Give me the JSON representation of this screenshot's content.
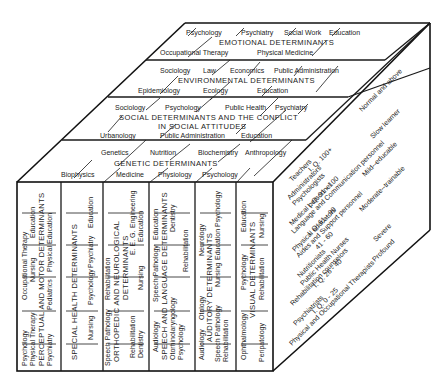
{
  "diagram": {
    "type": "3d-cube",
    "top_face": {
      "layers": [
        {
          "title": "EMOTIONAL DETERMINANTS",
          "back_row": [
            "Psychology",
            "Psychiatry",
            "Social Work",
            "Education"
          ],
          "front_row": [
            "Occupational Therapy",
            "Physical Medicine"
          ]
        },
        {
          "title": "ENVIRONMENTAL DETERMINANTS",
          "back_row": [
            "Sociology",
            "Law",
            "Economics",
            "Public Administration"
          ],
          "front_row": [
            "Epidemiology",
            "Ecology",
            "Education"
          ]
        },
        {
          "title_line1": "SOCIAL DETERMINANTS AND THE CONFLICT",
          "title_line2": "IN SOCIAL ATTITUDES",
          "back_row": [
            "Sociology",
            "Psychology",
            "Public Health",
            "Psychiatry"
          ],
          "front_row": [
            "Urbanology",
            "Public Administration",
            "Education"
          ]
        },
        {
          "title": "GENETIC DETERMINANTS",
          "back_row": [
            "Genetics",
            "Nutrition",
            "Biochemistry",
            "Anthropology"
          ],
          "front_row": [
            "Biophysics",
            "Medicine",
            "Physiology",
            "Psychology"
          ]
        }
      ]
    },
    "front_face": {
      "columns": [
        {
          "title": "PERCEPTUAL AND MOTOR DETERMINANTS",
          "line1": [
            "Psychology",
            "Occupational Therapy"
          ],
          "line2": [
            "Physical Therapy",
            "Nursing",
            "Education"
          ],
          "line4": [
            "Psychiatry",
            "Pediatrics",
            "Physical Education"
          ]
        },
        {
          "title": "SPECIAL HEALTH DETERMINANTS",
          "line2": [
            "Nursing",
            "Psychology",
            "Psychiatry",
            "Education"
          ]
        },
        {
          "title_line1": "ORTHOPEDIC AND NEUROLOGICAL",
          "title_line2": "DETERMINANTS",
          "line1": [
            "Speech Pathology",
            "Rehabilitation"
          ],
          "line3": [
            "Rehabilitation",
            "E. E. G.",
            "Engineering"
          ],
          "line4": [
            "Dentistry",
            "Nursing",
            "Education"
          ],
          "prefix_top": "Dentistry",
          "prefix_top2": "Nursing",
          "prefix_top3": "Education"
        },
        {
          "title": "SPEECH AND LANGUAGE DETERMINANTS",
          "line1": [
            "Audiology",
            "Speech Pathology",
            "Education"
          ],
          "line3": [
            "Otorhinolaryngology",
            "Dentistry"
          ],
          "line4": [
            "Psychology",
            "Rehabilitation"
          ]
        },
        {
          "title": "AUDITORY DETERMINANTS",
          "line1": [
            "Audiology",
            "Otology",
            "Neurology"
          ],
          "line3": [
            "Speech Pathology",
            "Nursing",
            "Education Psychology"
          ],
          "line4": [
            "Rehabilitation"
          ],
          "prefix": [
            "Rehabilitation",
            "Nursing"
          ]
        },
        {
          "title": "VISUAL DETERMINANTS",
          "line1": [
            "Ophthalmology",
            "Psychology",
            "Education"
          ],
          "line3": [
            "Peripatology",
            "Rehabilitation",
            "Nursing"
          ]
        }
      ]
    },
    "right_face": {
      "levels": [
        {
          "label": "Normal and above",
          "personnel": [
            "Teachers",
            "I. Q. 100+",
            "Administrators"
          ]
        },
        {
          "label": "Slow learner",
          "personnel": [
            "Psychologists",
            "I. Q. 91 - 100",
            "Medical personnel"
          ]
        },
        {
          "label": "Mild--educable",
          "personnel": [
            "Language and Communication personnel",
            "I. Q. 61 - 90",
            "Physical educators"
          ]
        },
        {
          "label": "Moderate--trainable",
          "personnel": [
            "Aides and Support personnel",
            "41 - 60",
            "I. Q."
          ]
        },
        {
          "label": "Severe",
          "personnel": [
            "Nutritionists",
            "Public Health Nurses",
            "I. Q. 26 - 40"
          ]
        },
        {
          "label": "Profound",
          "personnel": [
            "Rehabilitation counselors",
            "I. Q. 0 - 25",
            "Psychiatrists",
            "Physical and Occupational Therapists"
          ]
        }
      ]
    }
  }
}
